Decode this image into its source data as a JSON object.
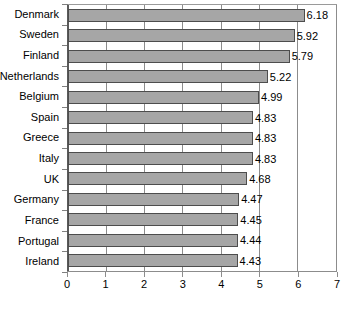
{
  "chart_data": {
    "type": "bar",
    "orientation": "horizontal",
    "title": "",
    "xlabel": "",
    "ylabel": "",
    "xlim": [
      0,
      7
    ],
    "xticks": [
      0,
      1,
      2,
      3,
      4,
      5,
      6,
      7
    ],
    "grid": true,
    "legend": false,
    "categories": [
      "Denmark",
      "Sweden",
      "Finland",
      "Netherlands",
      "Belgium",
      "Spain",
      "Greece",
      "Italy",
      "UK",
      "Germany",
      "France",
      "Portugal",
      "Ireland"
    ],
    "values": [
      6.18,
      5.92,
      5.79,
      5.22,
      4.99,
      4.83,
      4.83,
      4.83,
      4.68,
      4.47,
      4.45,
      4.44,
      4.43
    ],
    "value_labels": [
      "6.18",
      "5.92",
      "5.79",
      "5.22",
      "4.99",
      "4.83",
      "4.83",
      "4.83",
      "4.68",
      "4.47",
      "4.45",
      "4.44",
      "4.43"
    ],
    "xtick_labels": [
      "0",
      "1",
      "2",
      "3",
      "4",
      "5",
      "6",
      "7"
    ],
    "colors": {
      "bar_fill": "#a6a6a6",
      "bar_border": "#4d4d4d",
      "gridline": "#8c8c8c",
      "axis": "#5a5a5a",
      "plot_border": "#9a9a9a",
      "background": "#ffffff",
      "text": "#000000"
    }
  }
}
